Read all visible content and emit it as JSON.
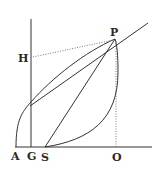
{
  "figure": {
    "ink_color": "#333333",
    "background": "#ffffff",
    "labels": {
      "P": "P",
      "H": "H",
      "A": "A",
      "G": "G",
      "S": "S",
      "O": "O"
    },
    "points": {
      "A": [
        16,
        147
      ],
      "G": [
        31,
        147
      ],
      "S": [
        45,
        147
      ],
      "O": [
        116,
        147
      ],
      "P": [
        115,
        39
      ],
      "H": [
        31,
        58
      ]
    }
  }
}
